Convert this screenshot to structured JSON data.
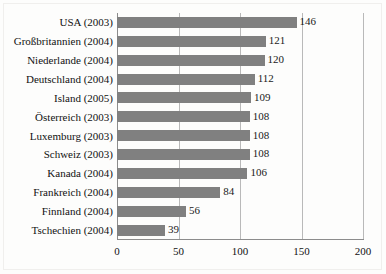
{
  "chart_data": {
    "type": "bar",
    "orientation": "horizontal",
    "title": "",
    "subtitle": "",
    "xlabel": "",
    "ylabel": "",
    "xlim": [
      0,
      200
    ],
    "xticks": [
      "0",
      "50",
      "100",
      "150",
      "200"
    ],
    "xtick_values": [
      0,
      50,
      100,
      150,
      200
    ],
    "grid": true,
    "legend": "none",
    "bar_color": "#808080",
    "gridline_color": "#b9b9b9",
    "axis_color": "#8c8c8c",
    "categories": [
      "USA (2003)",
      "Großbritannien (2004)",
      "Niederlande (2004)",
      "Deutschland (2004)",
      "Island (2005)",
      "Österreich (2003)",
      "Luxemburg (2003)",
      "Schweiz (2003)",
      "Kanada (2004)",
      "Frankreich (2004)",
      "Finnland (2004)",
      "Tschechien (2004)"
    ],
    "values": [
      146,
      121,
      120,
      112,
      109,
      108,
      108,
      108,
      106,
      84,
      56,
      39
    ],
    "data_labels": [
      "146",
      "121",
      "120",
      "112",
      "109",
      "108",
      "108",
      "108",
      "106",
      "84",
      "56",
      "39"
    ]
  }
}
